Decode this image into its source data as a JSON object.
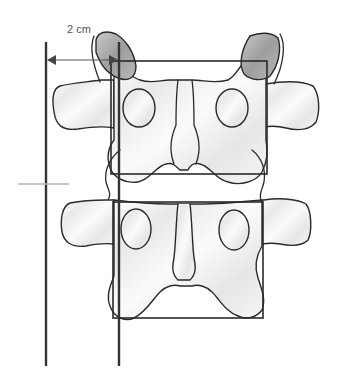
{
  "figure": {
    "type": "anatomical-diagram",
    "measurement": {
      "label": "2 cm",
      "arrow": {
        "from_x": 44,
        "to_x": 120,
        "y": 60
      }
    },
    "colors": {
      "bone_fill": "#f2f2f2",
      "outline": "#2a2a2a",
      "facet_shade": "#a8a8a8",
      "reference_lines": "#333333",
      "level_marker": "#b5b5b5",
      "label_text": "#555555"
    },
    "reference_lines": [
      {
        "name": "left-vertical-line",
        "x": 46,
        "y1": 42,
        "y2": 366
      },
      {
        "name": "right-vertical-line",
        "x": 119,
        "y1": 42,
        "y2": 366
      }
    ],
    "level_marker": {
      "x1": 18,
      "x2": 69,
      "y": 184
    },
    "boxes": [
      {
        "name": "upper-vertebra-box",
        "x": 111,
        "y": 61,
        "w": 156,
        "h": 113
      },
      {
        "name": "lower-vertebra-box",
        "x": 113,
        "y": 202,
        "w": 150,
        "h": 116
      }
    ]
  }
}
